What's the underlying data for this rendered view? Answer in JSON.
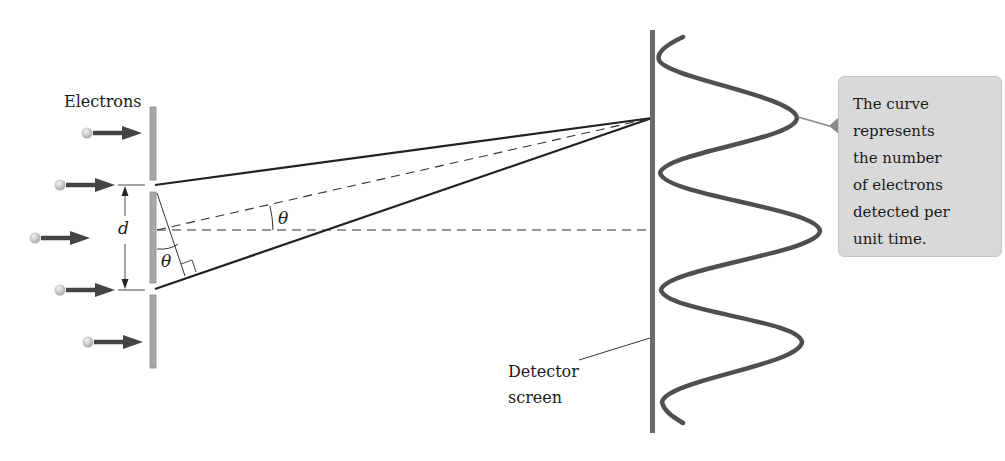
{
  "figure": {
    "labels": {
      "electrons": "Electrons",
      "slit_separation": "d",
      "angle_upper": "θ",
      "angle_lower": "θ",
      "detector_line1": "Detector",
      "detector_line2": "screen"
    },
    "callout": {
      "lines": [
        "The curve",
        "represents",
        "the number",
        "of electrons",
        "detected per",
        "unit time."
      ]
    },
    "colors": {
      "barrier": "#9a9a9a",
      "detector": "#5f5f5f",
      "curve": "#4a4a4a",
      "arrow": "#444444",
      "electron": "#c8c8c8",
      "callout_bg": "#d9d9d9",
      "line": "#222222"
    },
    "elements": {
      "electron_count": 5,
      "slit_count": 2,
      "interference_maxima_visible": 3,
      "interference_minima_visible": 4
    }
  }
}
